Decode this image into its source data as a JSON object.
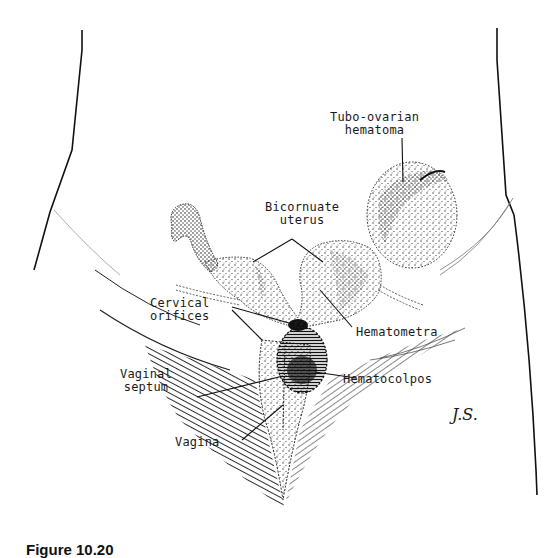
{
  "figure": {
    "labels": {
      "tubo_ovarian": [
        "Tubo-ovarian",
        "hematoma"
      ],
      "bicornuate": [
        "Bicornuate",
        "uterus"
      ],
      "cervical": [
        "Cervical",
        "orifices"
      ],
      "hematometra": "Hematometra",
      "vaginal_septum": [
        "Vaginal",
        "septum"
      ],
      "hematocolpos": "Hematocolpos",
      "vagina": "Vagina"
    },
    "artist_signature": "J.S.",
    "caption_partial": "Figure 10.20"
  },
  "colors": {
    "ink": "#1a1a1a",
    "background": "#ffffff",
    "stipple": "#333333"
  }
}
